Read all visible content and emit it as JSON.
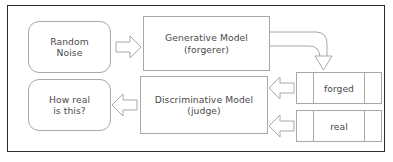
{
  "diagram": {
    "frame": {
      "border_color": "#2b2b2b",
      "background": "#ffffff"
    },
    "palette": {
      "shape_stroke": "#a8a8a8",
      "text_color": "#4a4a4a",
      "arrow_stroke": "#a8a8a8",
      "arrow_fill": "#ffffff"
    },
    "nodes": {
      "random_noise": {
        "line1": "Random",
        "line2": "Noise",
        "shape": "rounded-rectangle"
      },
      "generative_model": {
        "line1": "Generative Model",
        "line2": "(forgerer)",
        "shape": "rectangle"
      },
      "discriminative_model": {
        "line1": "Discriminative Model",
        "line2": "(judge)",
        "shape": "rectangle"
      },
      "how_real": {
        "line1": "How real",
        "line2": "is this?",
        "shape": "rounded-rectangle"
      },
      "forged_data": {
        "label": "forged",
        "shape": "three-cell-rectangle",
        "cells": 3
      },
      "real_data": {
        "label": "real",
        "shape": "three-cell-rectangle",
        "cells": 3
      }
    },
    "arrows": {
      "noise_to_generator": {
        "name": "block-arrow-right",
        "direction": "right"
      },
      "generator_to_forged": {
        "name": "elbow-arrow-down",
        "direction": "down"
      },
      "forged_to_discriminator": {
        "name": "block-arrow-left",
        "direction": "left"
      },
      "real_to_discriminator": {
        "name": "block-arrow-left",
        "direction": "left"
      },
      "discriminator_to_output": {
        "name": "block-arrow-left",
        "direction": "left"
      }
    }
  }
}
